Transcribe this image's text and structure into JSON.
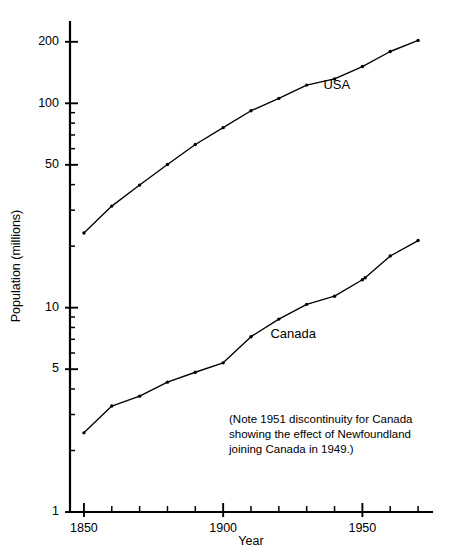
{
  "chart_data": {
    "type": "line",
    "title": "",
    "xlabel": "Year",
    "ylabel": "Population (millions)",
    "yscale": "log",
    "ylim": [
      1,
      250
    ],
    "xlim": [
      1845,
      1975
    ],
    "grid": false,
    "legend_position": "inline-labels",
    "x_ticks_major": [
      1850,
      1900,
      1950
    ],
    "x_tick_labels": [
      "1850",
      "1900",
      "1950"
    ],
    "x_ticks_minor": [
      1860,
      1870,
      1880,
      1890,
      1910,
      1920,
      1930,
      1940,
      1960,
      1970
    ],
    "y_ticks_major": [
      1,
      5,
      10,
      50,
      100,
      200
    ],
    "y_tick_labels": [
      "1",
      "5",
      "10",
      "50",
      "100",
      "200"
    ],
    "y_ticks_minor": [
      2,
      3,
      4,
      6,
      7,
      8,
      9,
      20,
      30,
      40,
      60,
      70,
      80,
      90
    ],
    "series": [
      {
        "name": "USA",
        "label": "USA",
        "label_x": 1936,
        "label_y": 118,
        "x": [
          1850,
          1860,
          1870,
          1880,
          1890,
          1900,
          1910,
          1920,
          1930,
          1940,
          1950,
          1960,
          1970
        ],
        "values": [
          23.2,
          31.4,
          39.8,
          50.2,
          62.9,
          76.0,
          92.0,
          105.7,
          122.8,
          131.7,
          151.3,
          179.3,
          203.2
        ]
      },
      {
        "name": "Canada",
        "label": "Canada",
        "label_x": 1917,
        "label_y": 7.1,
        "x": [
          1850,
          1860,
          1870,
          1880,
          1890,
          1900,
          1910,
          1920,
          1930,
          1940,
          1950,
          1951,
          1960,
          1970
        ],
        "values": [
          2.44,
          3.3,
          3.69,
          4.32,
          4.83,
          5.37,
          7.21,
          8.79,
          10.38,
          11.38,
          13.7,
          14.0,
          17.9,
          21.3
        ],
        "discontinuity_year": 1951,
        "discontinuity_note": "1951 discontinuity for Canada (Newfoundland joined Canada in 1949)"
      }
    ],
    "annotations": [
      {
        "name": "newfoundland-note",
        "lines": [
          "(Note 1951 discontinuity for Canada",
          "showing the effect of Newfoundland",
          "joining Canada in 1949.)"
        ]
      }
    ]
  },
  "colors": {
    "background": "#ffffff",
    "ink": "#000000"
  }
}
